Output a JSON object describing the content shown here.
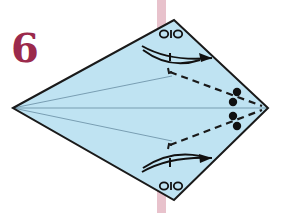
{
  "step": {
    "number": "6",
    "color": "#9b2a4c"
  },
  "diagram": {
    "type": "origami-kite-fold",
    "paper_color": "#bfe3f2",
    "outline_color": "#1a1a1a",
    "strip_color": "#e8c2cc",
    "vertices": {
      "left": [
        13,
        108
      ],
      "top": [
        174,
        20
      ],
      "right": [
        268,
        108
      ],
      "bottom": [
        174,
        200
      ]
    },
    "symbols": {
      "top_label": "OIO",
      "bottom_label": "OIO"
    },
    "icons": [
      "fold-arrow-icon",
      "dot-marker-icon",
      "valley-fold-line"
    ],
    "dots_count": 4
  }
}
